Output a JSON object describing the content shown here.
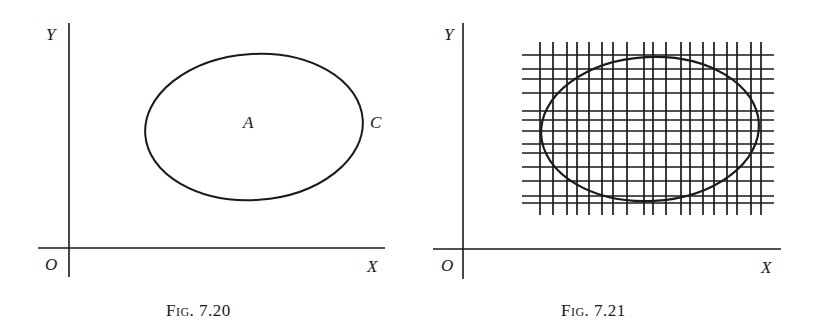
{
  "figures": [
    {
      "id": "fig-7-20",
      "caption": "Fig. 7.20",
      "axes": {
        "y_label": "Y",
        "x_label": "X",
        "origin_label": "O",
        "x_axis": {
          "y": 248,
          "x1": 38,
          "x2": 385
        },
        "y_axis": {
          "x": 69,
          "y1": 23,
          "y2": 277
        }
      },
      "region": {
        "center_label": "A",
        "boundary_label": "C",
        "ellipse": {
          "cx": 254,
          "cy": 127,
          "rx": 109,
          "ry": 73,
          "rotate": -4
        }
      },
      "label_positions": {
        "Y": [
          46,
          26
        ],
        "O": [
          45,
          256
        ],
        "X": [
          367,
          258
        ],
        "A": [
          243,
          114
        ],
        "C": [
          370,
          114
        ],
        "caption": [
          166,
          302
        ]
      }
    },
    {
      "id": "fig-7-21",
      "caption": "Fig. 7.21",
      "axes": {
        "y_label": "Y",
        "x_label": "X",
        "origin_label": "O",
        "x_axis": {
          "y": 249,
          "x1": 433,
          "x2": 781
        },
        "y_axis": {
          "x": 463,
          "y1": 23,
          "y2": 279
        }
      },
      "region": {
        "ellipse": {
          "cx": 650,
          "cy": 129,
          "rx": 109,
          "ry": 72,
          "rotate": -3
        }
      },
      "grid": {
        "vertical_x": [
          540,
          553,
          567,
          577,
          589,
          602,
          613,
          627,
          644,
          653,
          666,
          681,
          690,
          703,
          714,
          727,
          737,
          751,
          761
        ],
        "vertical_y_range": [
          42,
          215
        ],
        "horizontal_y": [
          55,
          69,
          79,
          93,
          111,
          120,
          131,
          144,
          153,
          167,
          181,
          196,
          203
        ],
        "horizontal_x_range": [
          522,
          774
        ]
      },
      "label_positions": {
        "Y": [
          444,
          26
        ],
        "O": [
          441,
          257
        ],
        "X": [
          761,
          259
        ],
        "caption": [
          561,
          302
        ]
      }
    }
  ],
  "colors": {
    "ink": "#1a1a1a",
    "background": "#ffffff"
  }
}
